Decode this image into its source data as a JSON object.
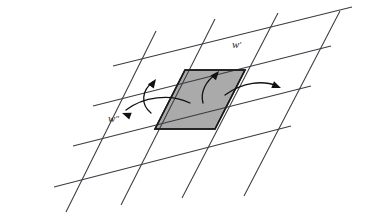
{
  "figure": {
    "background_color": "#ffffff",
    "line_color": "#3b3b40",
    "shaded_cell_color": "#aaaaaa",
    "shaded_cell_border_color": "#1a1a1a",
    "arrow_color": "#111111"
  },
  "labels": {
    "w_prime": "w",
    "w_prime_mark": "′",
    "w_double_prime": "w",
    "w_double_prime_mark": "″"
  },
  "chart_data": {
    "type": "scatter",
    "xlabel": "",
    "ylabel": "",
    "grid": true,
    "legend_position": "none",
    "annotations": [
      {
        "name": "w-prime",
        "text": "w′",
        "x": 232,
        "y": 48
      },
      {
        "name": "w-double-prime",
        "text": "w″",
        "x": 113,
        "y": 120
      }
    ],
    "steep_lines": [
      {
        "x1": 156,
        "y1": 31,
        "x2": 66,
        "y2": 212
      },
      {
        "x1": 215,
        "y1": 19,
        "x2": 121,
        "y2": 205
      },
      {
        "x1": 278,
        "y1": 13,
        "x2": 182,
        "y2": 198
      },
      {
        "x1": 340,
        "y1": 11,
        "x2": 244,
        "y2": 196
      }
    ],
    "shallow_lines": [
      {
        "x1": 54,
        "y1": 187,
        "x2": 291,
        "y2": 126
      },
      {
        "x1": 73,
        "y1": 146,
        "x2": 311,
        "y2": 86
      },
      {
        "x1": 93,
        "y1": 106,
        "x2": 331,
        "y2": 46
      },
      {
        "x1": 113,
        "y1": 66,
        "x2": 352,
        "y2": 7
      }
    ],
    "shaded_cell_vertices": [
      {
        "x": 155,
        "y": 129
      },
      {
        "x": 185,
        "y": 70
      },
      {
        "x": 245,
        "y": 70
      },
      {
        "x": 215,
        "y": 129
      }
    ],
    "flow_arrows": [
      {
        "name": "arrow-up-left",
        "path": "M 151 113 C 140 104 142 90 153 82",
        "head": {
          "x": 156,
          "y": 79,
          "angle": -55
        }
      },
      {
        "name": "arrow-up-right",
        "path": "M 203 103 C 200 92 206 81 216 74",
        "head": {
          "x": 219,
          "y": 71,
          "angle": -50
        }
      },
      {
        "name": "arrow-left",
        "path": "M 190 103 C 170 93 143 97 126 110",
        "head": {
          "x": 122,
          "y": 113,
          "angle": 200
        }
      },
      {
        "name": "arrow-right",
        "path": "M 225 95 C 243 82 263 80 277 86",
        "head": {
          "x": 281,
          "y": 88,
          "angle": 22
        }
      }
    ]
  }
}
